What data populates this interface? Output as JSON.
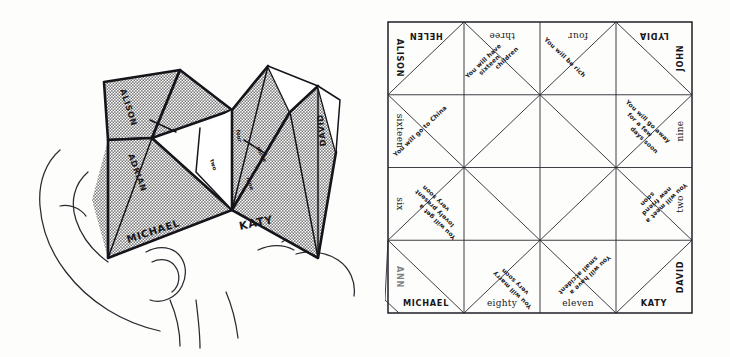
{
  "figure": {
    "panels": [
      {
        "id": "hand",
        "label": "hand-holding-fortune-teller"
      },
      {
        "id": "grid",
        "label": "unfolded-paper-grid"
      }
    ]
  },
  "folded": {
    "flap_labels": [
      {
        "name": "flap-label-alison",
        "text": "ALISON"
      },
      {
        "name": "flap-label-adrian",
        "text": "ADRIAN"
      },
      {
        "name": "flap-label-michael",
        "text": "MICHAEL"
      },
      {
        "name": "flap-label-katy",
        "text": "KATY"
      },
      {
        "name": "flap-label-david",
        "text": "DAVID"
      }
    ],
    "inner_marks": [
      {
        "name": "inner-mark-four",
        "text": "four"
      },
      {
        "name": "inner-mark-two",
        "text": "two"
      },
      {
        "name": "inner-mark-three",
        "text": "three"
      },
      {
        "name": "inner-mark-nine",
        "text": "nine"
      }
    ]
  },
  "grid": {
    "top_labels": [
      "HELEN",
      "three",
      "four",
      "LYDIA"
    ],
    "right_labels": [
      "JOHN",
      "nine",
      "two",
      "DAVID"
    ],
    "bottom_labels": [
      "MICHAEL",
      "eighty",
      "eleven",
      "KATY"
    ],
    "left_labels": [
      "ALISON",
      "sixteen",
      "six",
      "ANN"
    ],
    "names": [
      "HELEN",
      "LYDIA",
      "JOHN",
      "DAVID",
      "KATY",
      "MICHAEL",
      "ANN",
      "ALISON"
    ],
    "numbers": [
      "three",
      "four",
      "nine",
      "two",
      "eleven",
      "eighty",
      "six",
      "sixteen"
    ],
    "fortunes": [
      {
        "name": "fortune-sixteen-children",
        "text": "You will have sixteen children"
      },
      {
        "name": "fortune-be-rich",
        "text": "You will be rich"
      },
      {
        "name": "fortune-go-away",
        "text": "You will go away for a few days soon"
      },
      {
        "name": "fortune-meet-friend",
        "text": "You will meet a new friend soon"
      },
      {
        "name": "fortune-small-accident",
        "text": "You will have a small accident"
      },
      {
        "name": "fortune-marry-soon",
        "text": "You will marry very soon"
      },
      {
        "name": "fortune-lovely-present",
        "text": "You will get a lovely present very soon"
      },
      {
        "name": "fortune-go-to-china",
        "text": "You will go to China"
      }
    ],
    "fortune_lines": {
      "sixteen_children": [
        "You will have",
        "sixteen",
        "children"
      ],
      "be_rich": [
        "You will be rich"
      ],
      "go_away": [
        "You will go away",
        "for a few",
        "days soon"
      ],
      "meet_friend": [
        "You will meet a",
        "new friend",
        "soon"
      ],
      "small_accident": [
        "You will have a",
        "small accident"
      ],
      "marry_soon": [
        "You will marry",
        "very soon"
      ],
      "lovely_present": [
        "You will get a",
        "lovely present",
        "very soon"
      ],
      "go_to_china": [
        "You will go to China"
      ]
    }
  },
  "colors": {
    "ink": "#19171a",
    "line": "#2a2730",
    "paper": "#fdfdfc",
    "shade": "#8c8c8c"
  }
}
